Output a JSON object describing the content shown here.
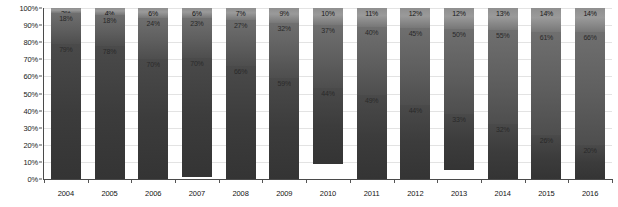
{
  "chart_data": {
    "type": "bar",
    "subtype": "100-percent-stacked-column",
    "title": "",
    "subtitle": "",
    "xlabel": "",
    "ylabel": "",
    "ylim": [
      0,
      100
    ],
    "y_unit": "%",
    "grid": true,
    "legend_position": "none",
    "categories": [
      "2004",
      "2005",
      "2006",
      "2007",
      "2008",
      "2009",
      "2010",
      "2011",
      "2012",
      "2013",
      "2014",
      "2015",
      "2016"
    ],
    "y_ticks": [
      "0%",
      "10%",
      "20%",
      "30%",
      "40%",
      "50%",
      "60%",
      "70%",
      "80%",
      "90%",
      "100%"
    ],
    "y_tick_values": [
      0,
      10,
      20,
      30,
      40,
      50,
      60,
      70,
      80,
      90,
      100
    ],
    "series": [
      {
        "name": "bottom-segment",
        "values": [
          79,
          78,
          70,
          70,
          66,
          59,
          44,
          49,
          44,
          33,
          32,
          26,
          20
        ],
        "labels": [
          "79%",
          "78%",
          "70%",
          "70%",
          "66%",
          "59%",
          "44%",
          "49%",
          "44%",
          "33%",
          "32%",
          "26%",
          "20%"
        ],
        "color": "#3c3c3c"
      },
      {
        "name": "middle-segment",
        "values": [
          18,
          18,
          24,
          23,
          27,
          32,
          37,
          40,
          45,
          50,
          55,
          61,
          66
        ],
        "labels": [
          "18%",
          "18%",
          "24%",
          "23%",
          "27%",
          "32%",
          "37%",
          "40%",
          "45%",
          "50%",
          "55%",
          "61%",
          "66%"
        ],
        "color": "#5e5e5e"
      },
      {
        "name": "top-segment",
        "values": [
          3,
          4,
          6,
          6,
          7,
          9,
          10,
          11,
          12,
          12,
          13,
          14,
          14
        ],
        "labels": [
          "3%",
          "4%",
          "6%",
          "6%",
          "7%",
          "9%",
          "10%",
          "11%",
          "12%",
          "12%",
          "13%",
          "14%",
          "14%"
        ],
        "color": "#9a9a9a"
      }
    ]
  }
}
